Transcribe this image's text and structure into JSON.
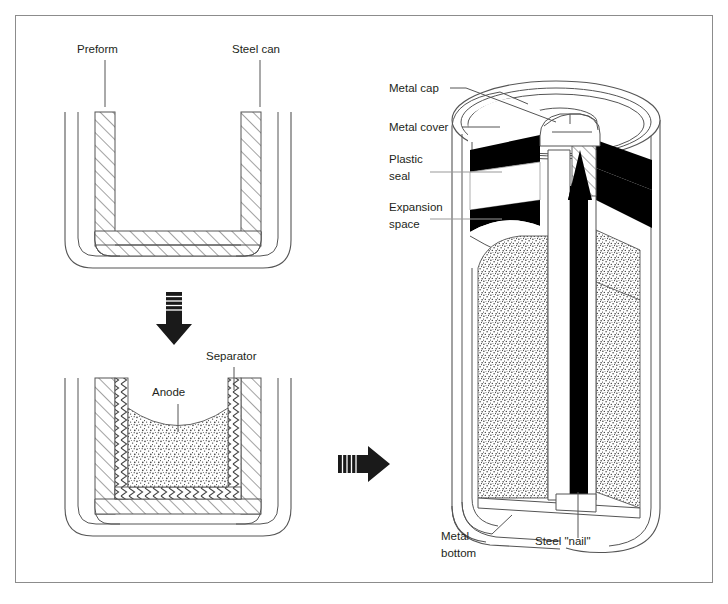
{
  "figure": {
    "title_text": "",
    "border_color": "#8c8c8c",
    "line_color": "#231f20",
    "text_color": "#231f20",
    "fill_white": "#ffffff",
    "fill_black": "#000000",
    "hatch_color": "#5a5a5a",
    "stipple_color": "#4a4a4a"
  },
  "stage1": {
    "name": "preform-in-steel-can",
    "labels": {
      "preform": "Preform",
      "steel_can": "Steel can"
    }
  },
  "stage2": {
    "name": "anode-and-separator",
    "labels": {
      "anode": "Anode",
      "separator": "Separator"
    }
  },
  "stage3": {
    "name": "assembled-cell-cutaway",
    "labels": {
      "metal_cap": "Metal cap",
      "metal_cover": "Metal cover",
      "plastic_seal_line1": "Plastic",
      "plastic_seal_line2": "seal",
      "expansion_space_line1": "Expansion",
      "expansion_space_line2": "space",
      "metal_bottom_line1": "Metal",
      "metal_bottom_line2": "bottom",
      "steel_nail": "Steel \"nail\""
    }
  },
  "arrows": {
    "down": "arrow-down",
    "right": "arrow-right"
  }
}
